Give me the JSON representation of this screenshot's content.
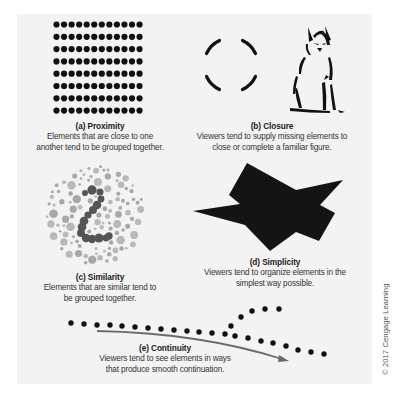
{
  "panels": {
    "proximity": {
      "title": "(a) Proximity",
      "desc_line1": "Elements that are close to one",
      "desc_line2": "another tend to be grouped together.",
      "grid": {
        "cols": 12,
        "rows": 8,
        "color": "#111111"
      }
    },
    "closure": {
      "title": "(b) Closure",
      "desc_line1": "Viewers tend to supply missing elements to",
      "desc_line2": "close or complete a familiar figure."
    },
    "similarity": {
      "title": "(c) Similarity",
      "desc_line1": "Elements that are similar tend to",
      "desc_line2": "be grouped together.",
      "hidden_figure": "2",
      "colors": {
        "light": "#a8a8a8",
        "dark": "#555555"
      }
    },
    "simplicity": {
      "title": "(d) Simplicity",
      "desc_line1": "Viewers tend to organize elements in the",
      "desc_line2": "simplest way possible."
    },
    "continuity": {
      "title": "(e) Continuity",
      "desc_line1": "Viewers tend to see elements in ways",
      "desc_line2": "that produce smooth continuation."
    }
  },
  "copyright": "© 2017 Cengage Learning",
  "colors": {
    "background": "#f3f3f3",
    "ink": "#111111",
    "arrow": "#6b6b6b"
  }
}
